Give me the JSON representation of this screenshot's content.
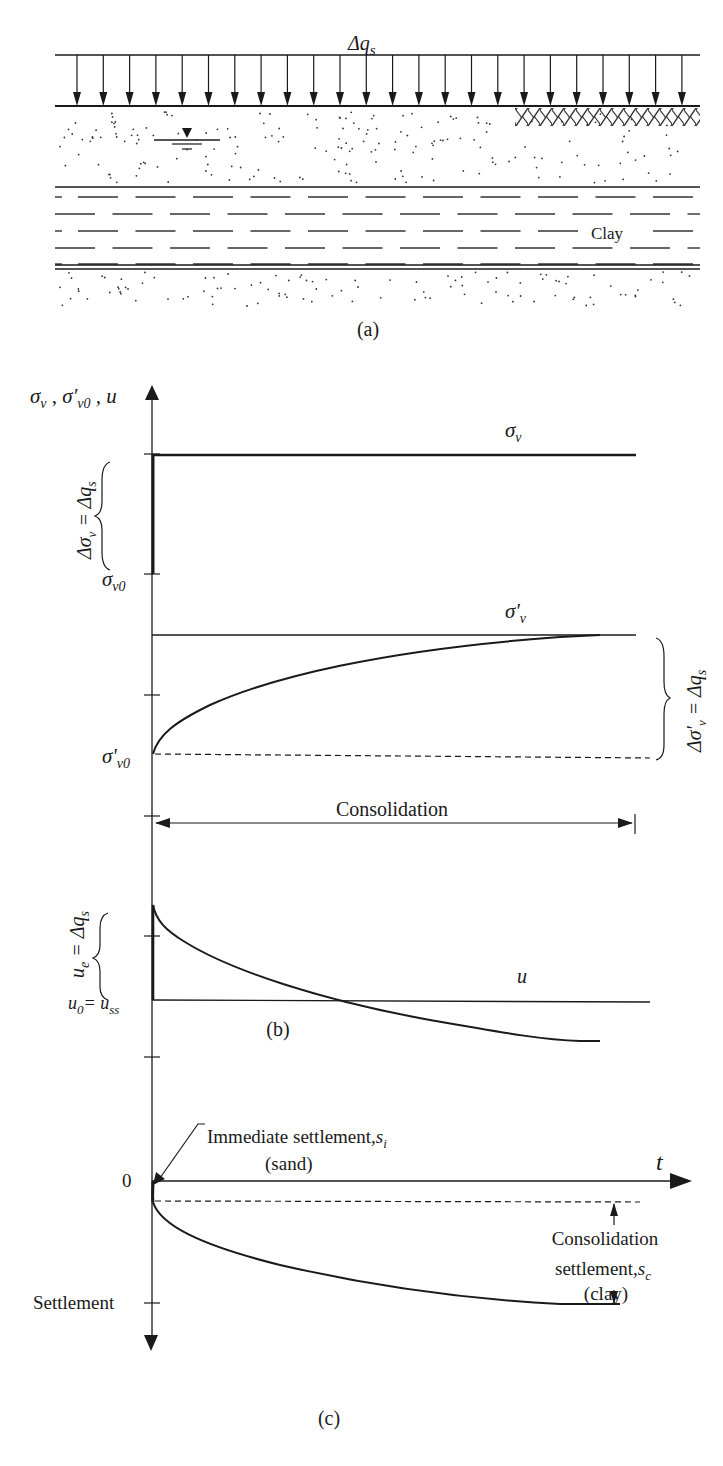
{
  "panel_a": {
    "load_label": "Δq",
    "load_sub": "s",
    "layer_label": "Clay",
    "caption": "(a)",
    "layers": [
      "sand",
      "clay",
      "sand"
    ],
    "load_arrow_count": 24
  },
  "panel_b": {
    "y_axis_label": "σ",
    "y_axis_label_full": "σv , σ'v0 , u",
    "sigma_v_label": "σ",
    "sigma_v_sub": "v",
    "sigma_v_eff_label": "σ'",
    "sigma_v_eff_sub": "v",
    "sigma_v0_label": "σ",
    "sigma_v0_sub": "v0",
    "sigma_v0_eff_label": "σ'",
    "sigma_v0_eff_sub": "v0",
    "delta_sigma_v_brace": "Δσv = Δqs",
    "delta_sigma_v_eff_brace": "Δσ'v = Δqs",
    "consolidation_label": "Consolidation",
    "ue_brace": "ue = Δqs",
    "u0_label": "u0= uss",
    "u_label": "u",
    "caption": "(b)"
  },
  "panel_c": {
    "zero_label": "0",
    "t_label": "t",
    "settlement_label": "Settlement",
    "immediate_label": "Immediate settlement, si",
    "immediate_sub_label": "(sand)",
    "consolidation_label_1": "Consolidation",
    "consolidation_label_2": "settlement, sc",
    "consolidation_label_3": "(clay)",
    "caption": "(c)"
  }
}
